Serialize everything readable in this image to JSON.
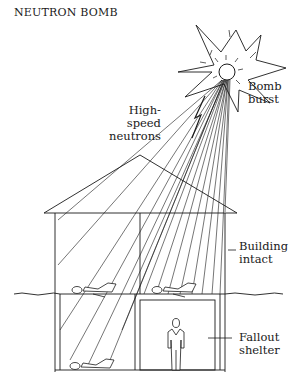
{
  "title": "NEUTRON BOMB",
  "labels": {
    "bomb_burst": [
      "Bomb",
      "burst"
    ],
    "neutrons": [
      "High-speed",
      "neutrons"
    ],
    "building": [
      "Building",
      "intact"
    ],
    "shelter": [
      "Fallout",
      "shelter"
    ]
  },
  "colors": {
    "ink": "#1a1a1a",
    "background": "#ffffff"
  }
}
